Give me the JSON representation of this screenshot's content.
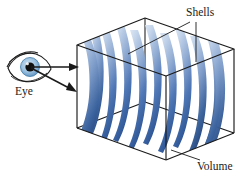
{
  "figure": {
    "background_color": "#ffffff",
    "width": 247,
    "height": 175
  },
  "labels": {
    "eye": "Eye",
    "shells": "Shells",
    "volume": "Volume"
  },
  "icons": {
    "eye": "eye-icon",
    "arrow_upper": "view-ray-arrow-icon",
    "arrow_lower": "view-ray-arrow-icon"
  },
  "colors": {
    "outline": "#1a1a1a",
    "shell_light": "#cfdcee",
    "shell_mid": "#8ba8ce",
    "shell_dark": "#3a63a8",
    "shell_deep": "#26477f",
    "eye_iris": "#9dc2e0",
    "eye_iris_edge": "#5b8fbe",
    "eye_pupil": "#101010",
    "eye_sclera": "#ffffff",
    "eye_outline": "#1a1a1a",
    "leader_line": "#1a1a1a"
  },
  "geometry": {
    "box": {
      "front_top_left": [
        77,
        45
      ],
      "front_top_right": [
        166,
        76
      ],
      "front_bottom_right": [
        166,
        160
      ],
      "front_bottom_left": [
        77,
        128
      ],
      "back_top_left": [
        145,
        18
      ],
      "back_top_right": [
        234,
        49
      ],
      "back_bottom_right": [
        234,
        133
      ],
      "depth_vector": [
        68,
        -27
      ]
    },
    "shell_count": 10,
    "shell_spacing_px": 15.5,
    "shell_curvature": "convex-left nested spherical arcs centered at eye"
  },
  "annotations": {
    "eye_position": [
      28,
      67
    ],
    "shells_label_position": [
      186,
      15
    ],
    "volume_label_position": [
      197,
      167
    ],
    "shell_leader_targets": [
      [
        128,
        54
      ],
      [
        196,
        62
      ]
    ],
    "volume_leader_target": [
      171,
      150
    ]
  }
}
